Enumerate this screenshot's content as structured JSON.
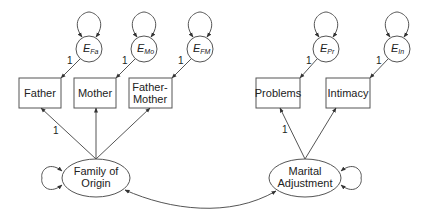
{
  "diagram": {
    "type": "structural-equation-model",
    "observed": [
      {
        "id": "father",
        "label": "Father",
        "error": {
          "base": "E",
          "sub": "Fa"
        },
        "loading_label": "1"
      },
      {
        "id": "mother",
        "label": "Mother",
        "error": {
          "base": "E",
          "sub": "Mo"
        },
        "loading_label": "1"
      },
      {
        "id": "father_mother",
        "label_line1": "Father-",
        "label_line2": "Mother",
        "error": {
          "base": "E",
          "sub": "FM"
        },
        "loading_label": "1"
      },
      {
        "id": "problems",
        "label": "Problems",
        "error": {
          "base": "E",
          "sub": "Pr"
        },
        "loading_label": "1"
      },
      {
        "id": "intimacy",
        "label": "Intimacy",
        "error": {
          "base": "E",
          "sub": "In"
        },
        "loading_label": "1"
      }
    ],
    "latent": [
      {
        "id": "family_of_origin",
        "label_line1": "Family of",
        "label_line2": "Origin",
        "fixed_loading_label": "1"
      },
      {
        "id": "marital_adjustment",
        "label_line1": "Marital",
        "label_line2": "Adjustment",
        "fixed_loading_label": "1"
      }
    ],
    "colors": {
      "stroke": "#555555",
      "text": "#222222",
      "background": "#ffffff"
    }
  }
}
